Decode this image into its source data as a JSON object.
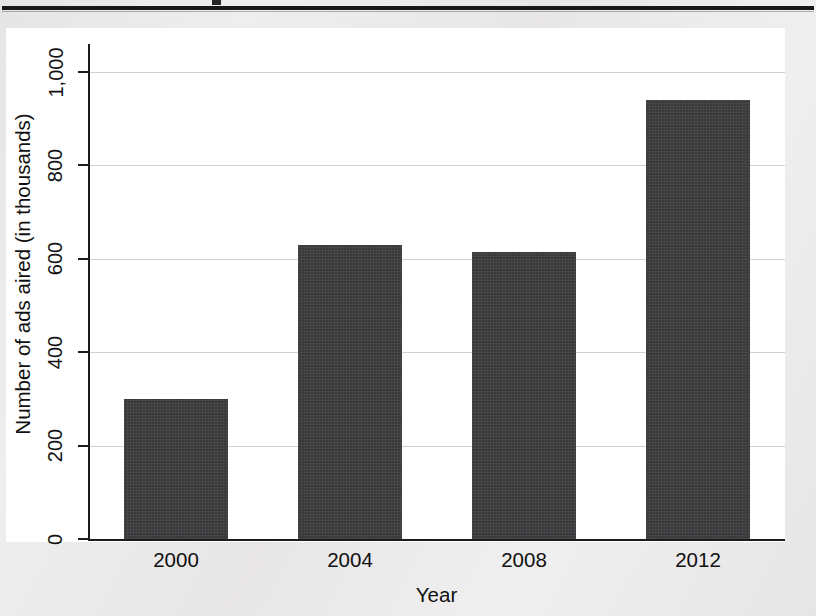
{
  "document": {
    "top_rule": "horizontal-rule",
    "title_remnant": ""
  },
  "chart_data": {
    "type": "bar",
    "title": "",
    "subtitle": "",
    "xlabel": "Year",
    "ylabel": "Number of ads aired (in thousands)",
    "categories": [
      "2000",
      "2004",
      "2008",
      "2012"
    ],
    "values": [
      300,
      630,
      615,
      940
    ],
    "series": [
      {
        "name": "Number of ads aired (in thousands)",
        "values": [
          300,
          630,
          615,
          940
        ]
      }
    ],
    "ylim": [
      0,
      1000
    ],
    "yticks": [
      0,
      200,
      400,
      600,
      800,
      1000
    ],
    "ytick_labels": [
      "0",
      "200",
      "400",
      "600",
      "800",
      "1,000"
    ],
    "grid": true,
    "grid_axis": "y",
    "legend": false,
    "legend_position": "none",
    "bar_color": "#39393b",
    "plot_background": "#ffffff",
    "page_background": "#eceaea",
    "axis_color": "#1c1c1c",
    "gridline_color": "#acacac",
    "annotations": []
  }
}
